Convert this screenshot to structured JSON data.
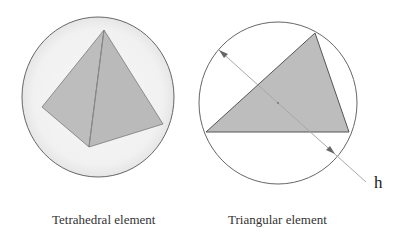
{
  "figure": {
    "left_panel": {
      "caption": "Tetrahedral element",
      "shape": "tetrahedron inscribed in sphere"
    },
    "right_panel": {
      "caption": "Triangular element",
      "shape": "triangle inscribed in circle",
      "dimension_label": "h"
    },
    "colors": {
      "fill_gray": "#bdbdbd",
      "sphere_fill": "#f2f2f2",
      "outline": "#666666",
      "dimension_line": "#a8a8a8"
    }
  }
}
